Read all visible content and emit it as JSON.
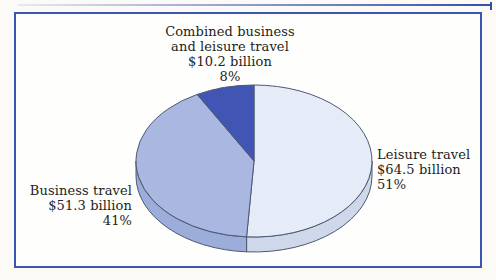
{
  "chart_data": {
    "type": "pie",
    "style": "3d-ellipse",
    "title": "",
    "direction": "clockwise",
    "start_angle_deg": 0,
    "stroke_color": "#4d5873",
    "frame_color": "#3c55b0",
    "slices": [
      {
        "label": "Leisure travel",
        "value_text": "$64.5 billion",
        "value_billion": 64.5,
        "percent": 51,
        "color": "#e6ecf7",
        "side_color": "#cfd8ea"
      },
      {
        "label": "Business travel",
        "value_text": "$51.3 billion",
        "value_billion": 51.3,
        "percent": 41,
        "color": "#aab8e1",
        "side_color": "#9cadd9"
      },
      {
        "label": "Combined business and leisure travel",
        "value_text": "$10.2 billion",
        "value_billion": 10.2,
        "percent": 8,
        "color": "#4156b4",
        "side_color": "#34499f"
      }
    ]
  },
  "labels": {
    "combined": {
      "lines": [
        "Combined business",
        "and leisure travel",
        "$10.2 billion",
        "8%"
      ]
    },
    "leisure": {
      "lines": [
        "Leisure travel",
        "$64.5 billion",
        "51%"
      ]
    },
    "business": {
      "lines": [
        "Business travel",
        "$51.3 billion",
        "41%"
      ]
    }
  }
}
